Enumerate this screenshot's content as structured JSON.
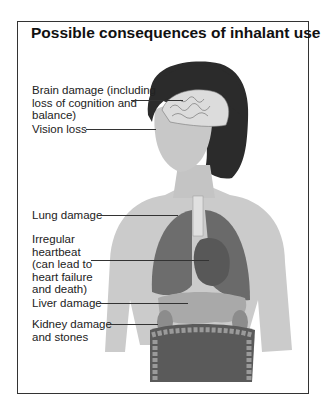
{
  "title": "Possible consequences of inhalant use",
  "labels": [
    {
      "id": "brain",
      "lines": [
        "Brain damage (including",
        "loss of cognition and",
        "balance)"
      ]
    },
    {
      "id": "vision",
      "lines": [
        "Vision loss"
      ]
    },
    {
      "id": "lung",
      "lines": [
        "Lung damage"
      ]
    },
    {
      "id": "heart",
      "lines": [
        "Irregular",
        "heartbeat",
        "(can lead to",
        "heart failure",
        "and death)"
      ]
    },
    {
      "id": "liver",
      "lines": [
        "Liver damage"
      ]
    },
    {
      "id": "kidney",
      "lines": [
        "Kidney damage",
        "and stones"
      ]
    }
  ],
  "illustration": {
    "subject": "female torso with head showing brain, eyes, lungs, heart, liver, kidneys, intestines",
    "palette": {
      "skin": "#c9c9c9",
      "hair": "#2a2a2a",
      "organs_dark": "#6e6e6e",
      "brain": "#d8d8d8"
    }
  }
}
